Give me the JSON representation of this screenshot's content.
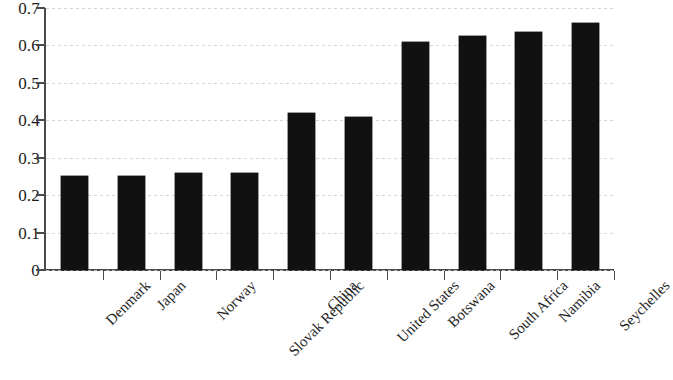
{
  "chart_data": {
    "type": "bar",
    "title": "",
    "subtitle": "",
    "xlabel": "",
    "ylabel": "",
    "categories": [
      "Denmark",
      "Japan",
      "Norway",
      "Slovak Republic",
      "China",
      "United States",
      "Botswana",
      "South Africa",
      "Namibia",
      "Seychelles"
    ],
    "values": [
      0.25,
      0.25,
      0.26,
      0.26,
      0.42,
      0.41,
      0.61,
      0.625,
      0.635,
      0.66
    ],
    "series": [
      {
        "name": "",
        "values": [
          0.25,
          0.25,
          0.26,
          0.26,
          0.42,
          0.41,
          0.61,
          0.625,
          0.635,
          0.66
        ]
      }
    ],
    "ylim": [
      0,
      0.7
    ],
    "ytick_labels": [
      "0",
      "0.1",
      "0.2",
      "0.3",
      "0.4",
      "0.5",
      "0.6",
      "0.7"
    ],
    "ytick_values": [
      0,
      0.1,
      0.2,
      0.3,
      0.4,
      0.5,
      0.6,
      0.7
    ],
    "grid": true,
    "grid_axis": "y",
    "legend": false,
    "legend_position": "none",
    "bar_color": "#111111",
    "grid_color": "#cfcfcf",
    "axis_color": "#4a4a4a",
    "background_color": "#ffffff",
    "xtick_label_rotation": -45
  }
}
